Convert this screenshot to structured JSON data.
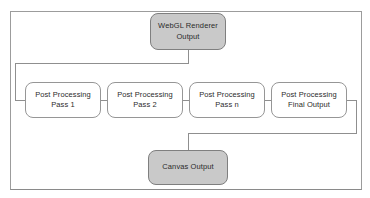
{
  "diagram": {
    "type": "flowchart",
    "nodes": [
      {
        "id": "webgl-renderer-output",
        "line1": "WebGL Renderer",
        "line2": "Output",
        "style": "filled"
      },
      {
        "id": "post-processing-pass-1",
        "line1": "Post Processing",
        "line2": "Pass 1",
        "style": "outline"
      },
      {
        "id": "post-processing-pass-2",
        "line1": "Post Processing",
        "line2": "Pass 2",
        "style": "outline"
      },
      {
        "id": "post-processing-pass-n",
        "line1": "Post Processing",
        "line2": "Pass n",
        "style": "outline"
      },
      {
        "id": "post-processing-final-output",
        "line1": "Post Processing",
        "line2": "Final Output",
        "style": "outline"
      },
      {
        "id": "canvas-output",
        "line1": "Canvas Output",
        "line2": "",
        "style": "filled"
      }
    ],
    "edges": [
      {
        "from": "webgl-renderer-output",
        "to": "post-processing-pass-1"
      },
      {
        "from": "post-processing-pass-1",
        "to": "post-processing-pass-2"
      },
      {
        "from": "post-processing-pass-2",
        "to": "post-processing-pass-n"
      },
      {
        "from": "post-processing-pass-n",
        "to": "post-processing-final-output"
      },
      {
        "from": "post-processing-final-output",
        "to": "canvas-output"
      }
    ],
    "colors": {
      "filled_node_fill": "#c9c9c9",
      "filled_node_border": "#7f7f7f",
      "outline_node_fill": "#ffffff",
      "outline_node_border": "#969696",
      "connector": "#8f8f8f",
      "frame_border": "#9c9c9c",
      "text": "#2b2b2b"
    }
  }
}
